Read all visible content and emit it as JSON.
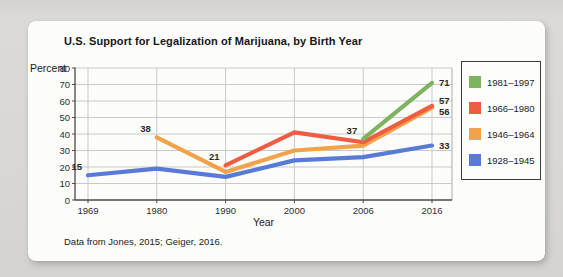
{
  "window": {
    "page_background": "#d8d7d3",
    "card_background": "#fcfcfa"
  },
  "chart_data": {
    "type": "line",
    "title": "U.S. Support for Legalization of Marijuana, by Birth Year",
    "xlabel": "Year",
    "ylabel": "Percent",
    "source_note": "Data from Jones, 2015; Geiger, 2016.",
    "x_ticks": [
      1969,
      1980,
      1990,
      2000,
      2006,
      2016
    ],
    "x_scale": "categorical-even-spacing",
    "y_ticks": [
      0,
      10,
      20,
      30,
      40,
      50,
      60,
      70,
      80
    ],
    "ylim": [
      0,
      80
    ],
    "grid": true,
    "legend_position": "right",
    "series": [
      {
        "name": "1928–1945",
        "color": "#5a7bd5",
        "x": [
          1969,
          1980,
          1990,
          2000,
          2006,
          2016
        ],
        "y": [
          15,
          19,
          14,
          24,
          26,
          33
        ],
        "point_labels": [
          {
            "x": 1969,
            "text": "15"
          },
          {
            "x": 2016,
            "text": "33"
          }
        ]
      },
      {
        "name": "1946–1964",
        "color": "#f2a24b",
        "x": [
          1980,
          1990,
          2000,
          2006,
          2016
        ],
        "y": [
          38,
          17,
          30,
          33,
          56
        ],
        "point_labels": [
          {
            "x": 1980,
            "text": "38"
          },
          {
            "x": 2016,
            "text": "56"
          }
        ]
      },
      {
        "name": "1966–1980",
        "color": "#ee5d42",
        "x": [
          1990,
          2000,
          2006,
          2016
        ],
        "y": [
          21,
          41,
          35,
          57
        ],
        "point_labels": [
          {
            "x": 1990,
            "text": "21"
          },
          {
            "x": 2016,
            "text": "57"
          }
        ]
      },
      {
        "name": "1981–1997",
        "color": "#7eb35f",
        "x": [
          2006,
          2016
        ],
        "y": [
          37,
          71
        ],
        "point_labels": [
          {
            "x": 2006,
            "text": "37"
          },
          {
            "x": 2016,
            "text": "71"
          }
        ]
      }
    ],
    "legend": {
      "items": [
        {
          "label": "1981–1997",
          "color": "#7eb35f"
        },
        {
          "label": "1966–1980",
          "color": "#ee5d42"
        },
        {
          "label": "1946–1964",
          "color": "#f2a24b"
        },
        {
          "label": "1928–1945",
          "color": "#5a7bd5"
        }
      ]
    }
  }
}
